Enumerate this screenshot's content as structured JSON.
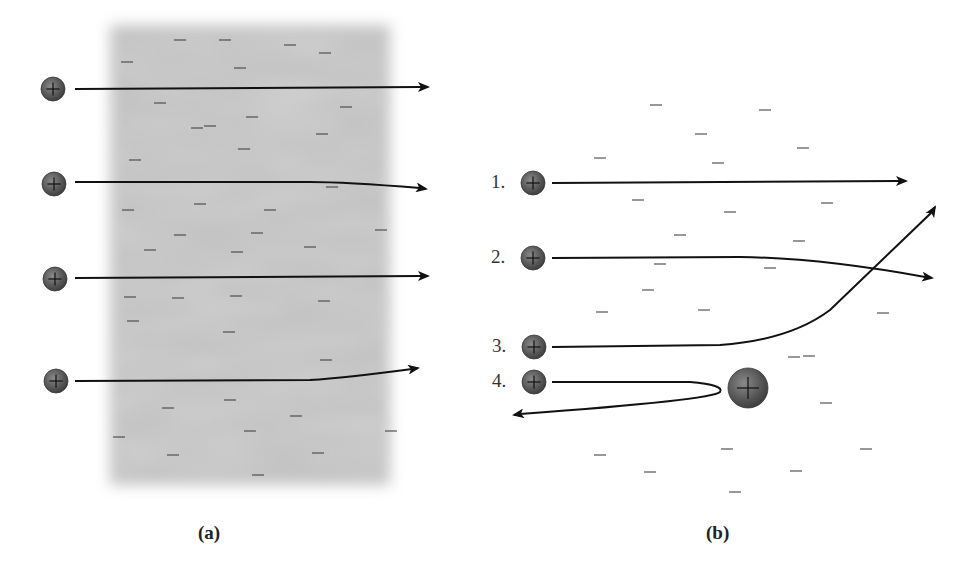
{
  "figure": {
    "panel_a": {
      "caption": "(a)",
      "description": "Alpha particles passing through a plum-pudding atom (diffuse negative charge region)",
      "slab": {
        "x": 110,
        "y": 25,
        "width": 280,
        "height": 460,
        "color": "#c4c4c4"
      },
      "particles": [
        {
          "x": 53,
          "y": 89,
          "path": "M75,89 L420,87",
          "end": [
            428,
            87
          ]
        },
        {
          "x": 54,
          "y": 184,
          "path": "M75,182 L310,182 Q345,182 420,188",
          "end": [
            426,
            189
          ]
        },
        {
          "x": 55,
          "y": 279,
          "path": "M75,278 L420,276",
          "end": [
            428,
            276
          ]
        },
        {
          "x": 56,
          "y": 381,
          "path": "M75,381 L310,380 Q345,378 412,369",
          "end": [
            418,
            368
          ]
        }
      ],
      "electrons": [
        [
          180,
          40
        ],
        [
          225,
          40
        ],
        [
          290,
          45
        ],
        [
          325,
          53
        ],
        [
          127,
          62
        ],
        [
          240,
          68
        ],
        [
          160,
          103
        ],
        [
          210,
          126
        ],
        [
          252,
          117
        ],
        [
          346,
          107
        ],
        [
          197,
          128
        ],
        [
          322,
          134
        ],
        [
          244,
          149
        ],
        [
          135,
          160
        ],
        [
          332,
          187
        ],
        [
          200,
          204
        ],
        [
          270,
          210
        ],
        [
          128,
          210
        ],
        [
          180,
          235
        ],
        [
          257,
          233
        ],
        [
          381,
          230
        ],
        [
          310,
          247
        ],
        [
          150,
          250
        ],
        [
          237,
          252
        ],
        [
          130,
          297
        ],
        [
          178,
          298
        ],
        [
          236,
          296
        ],
        [
          324,
          301
        ],
        [
          133,
          321
        ],
        [
          229,
          332
        ],
        [
          326,
          360
        ],
        [
          168,
          408
        ],
        [
          230,
          400
        ],
        [
          296,
          416
        ],
        [
          119,
          437
        ],
        [
          250,
          431
        ],
        [
          391,
          431
        ],
        [
          173,
          455
        ],
        [
          318,
          453
        ],
        [
          258,
          475
        ]
      ]
    },
    "panel_b": {
      "caption": "(b)",
      "description": "Alpha particles scattering from a dense positive nucleus (Rutherford model)",
      "nucleus": {
        "x": 748,
        "y": 388,
        "r": 20
      },
      "trajectories": [
        {
          "label": "1.",
          "particle": {
            "x": 533,
            "y": 183
          },
          "path": "M552,183 L898,181",
          "end": [
            906,
            181
          ]
        },
        {
          "label": "2.",
          "particle": {
            "x": 533,
            "y": 258
          },
          "path": "M552,258 L740,257 Q820,258 925,277",
          "end": [
            932,
            278
          ]
        },
        {
          "label": "3.",
          "particle": {
            "x": 534,
            "y": 347
          },
          "path": "M552,347 L720,345 Q790,340 830,310 L932,212",
          "end": [
            935,
            207
          ]
        },
        {
          "label": "4.",
          "particle": {
            "x": 534,
            "y": 382
          },
          "path": "M552,382 L690,382 Q725,385 720,392 Q712,400 520,414",
          "end": [
            514,
            415
          ]
        }
      ],
      "electrons": [
        [
          656,
          105
        ],
        [
          765,
          110
        ],
        [
          701,
          134
        ],
        [
          600,
          158
        ],
        [
          718,
          163
        ],
        [
          803,
          148
        ],
        [
          638,
          200
        ],
        [
          730,
          212
        ],
        [
          827,
          203
        ],
        [
          680,
          235
        ],
        [
          799,
          241
        ],
        [
          660,
          264
        ],
        [
          770,
          268
        ],
        [
          648,
          290
        ],
        [
          602,
          312
        ],
        [
          704,
          310
        ],
        [
          883,
          313
        ],
        [
          794,
          357
        ],
        [
          809,
          356
        ],
        [
          826,
          403
        ],
        [
          600,
          455
        ],
        [
          727,
          449
        ],
        [
          866,
          449
        ],
        [
          650,
          472
        ],
        [
          796,
          471
        ],
        [
          735,
          492
        ]
      ]
    },
    "colors": {
      "ink": "#111111",
      "particle_fill": "#5a5a5a",
      "particle_edge": "#3a3a3a",
      "electron": "#444444",
      "slab": "#c4c4c4"
    }
  }
}
